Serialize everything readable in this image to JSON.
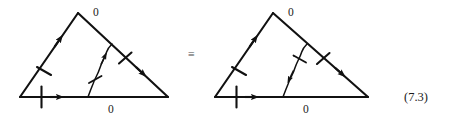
{
  "figure": {
    "equation_number": "(7.3)",
    "equivalence_symbol": "≡",
    "stroke_color": "#111111",
    "background_color": "#ffffff",
    "left_triangle": {
      "name": "triangle-left",
      "apex_label": "0",
      "base_label": "0",
      "vertices": {
        "apex": [
          78,
          13
        ],
        "bottom_left": [
          20,
          97
        ],
        "bottom_right": [
          168,
          97
        ]
      },
      "edges": [
        {
          "name": "left-edge",
          "from": [
            20,
            97
          ],
          "to": [
            78,
            13
          ],
          "arrow_direction": "up-right",
          "arrow_position": 0.72,
          "tick_count": 1,
          "tick_position": 0.42
        },
        {
          "name": "hypotenuse-edge",
          "from": [
            78,
            13
          ],
          "to": [
            168,
            97
          ],
          "arrow_direction": "down-right",
          "arrow_position": 0.73,
          "tick_count": 1,
          "tick_position": 0.62
        },
        {
          "name": "base-edge",
          "from": [
            20,
            97
          ],
          "to": [
            168,
            97
          ],
          "arrow_direction": "right",
          "arrow_position": 0.34,
          "tick_count": 1,
          "tick_position": 0.18
        },
        {
          "name": "internal-diagonal",
          "from": [
            88,
            97
          ],
          "to": [
            112,
            44
          ],
          "arrow_direction": "up-right",
          "arrow_position": 0.66,
          "tick_count": 1,
          "tick_position": 0.36,
          "style": "wavy"
        }
      ]
    },
    "right_triangle": {
      "name": "triangle-right",
      "apex_label": "0",
      "base_label": "0",
      "vertices": {
        "apex": [
          273,
          13
        ],
        "bottom_left": [
          215,
          97
        ],
        "bottom_right": [
          368,
          97
        ]
      },
      "edges": [
        {
          "name": "left-edge",
          "from": [
            215,
            97
          ],
          "to": [
            273,
            13
          ],
          "arrow_direction": "up-right",
          "arrow_position": 0.72,
          "tick_count": 1,
          "tick_position": 0.42
        },
        {
          "name": "hypotenuse-edge",
          "from": [
            273,
            13
          ],
          "to": [
            368,
            97
          ],
          "arrow_direction": "down-right",
          "arrow_position": 0.73,
          "tick_count": 1,
          "tick_position": 0.62
        },
        {
          "name": "base-edge",
          "from": [
            215,
            97
          ],
          "to": [
            368,
            97
          ],
          "arrow_direction": "right",
          "arrow_position": 0.34,
          "tick_count": 1,
          "tick_position": 0.18
        },
        {
          "name": "internal-diagonal",
          "from": [
            307,
            44
          ],
          "to": [
            283,
            97
          ],
          "arrow_direction": "down-left",
          "arrow_position": 0.66,
          "tick_count": 1,
          "tick_position": 0.36,
          "style": "wavy"
        }
      ]
    }
  }
}
